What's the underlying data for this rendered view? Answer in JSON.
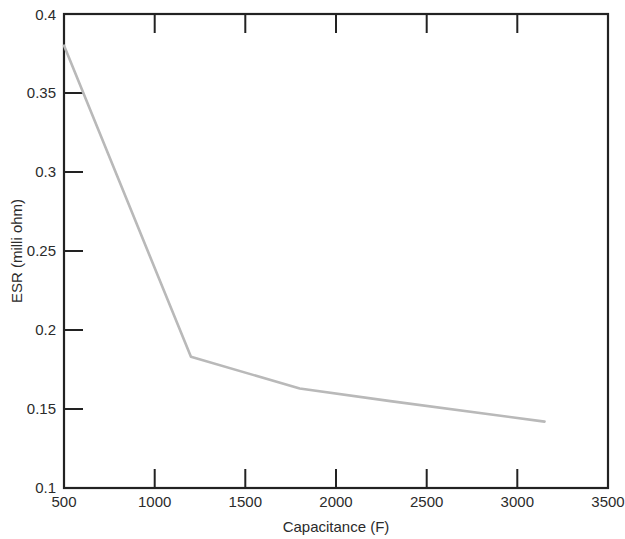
{
  "chart_data": {
    "type": "line",
    "title": "",
    "xlabel": "Capacitance (F)",
    "ylabel": "ESR (milli ohm)",
    "xlim": [
      500,
      3500
    ],
    "ylim": [
      0.1,
      0.4
    ],
    "grid": false,
    "legend": null,
    "xticks": [
      500,
      1000,
      1500,
      2000,
      2500,
      3000,
      3500
    ],
    "xtick_labels": [
      "500",
      "1000",
      "1500",
      "2000",
      "2500",
      "3000",
      "3500"
    ],
    "yticks": [
      0.1,
      0.15,
      0.2,
      0.25,
      0.3,
      0.35,
      0.4
    ],
    "ytick_labels": [
      "0.1",
      "0.15",
      "0.2",
      "0.25",
      "0.3",
      "0.35",
      "0.4"
    ],
    "line_color": "#b9b9b9",
    "axis_color": "#222222",
    "series": [
      {
        "name": "ESR vs Capacitance",
        "x": [
          500,
          1200,
          1800,
          2300,
          3150
        ],
        "y": [
          0.38,
          0.183,
          0.163,
          0.155,
          0.142
        ]
      }
    ]
  },
  "axis": {
    "x_title": "Capacitance (F)",
    "y_title": "ESR (milli ohm)"
  }
}
